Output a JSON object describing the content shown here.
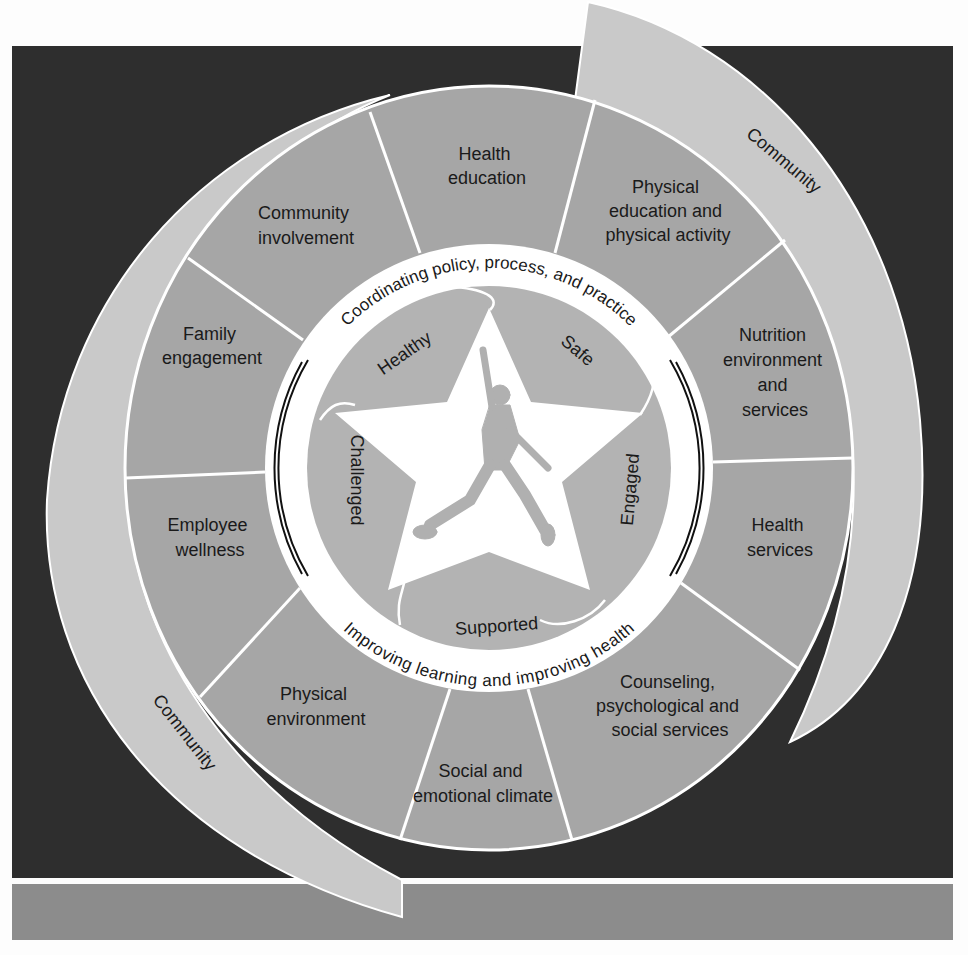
{
  "colors": {
    "background": "#fdfdfd",
    "dark_panel": "#2e2e2e",
    "bottom_bar": "#8c8c8c",
    "community_band": "#c9c9c9",
    "segment_fill": "#a6a6a6",
    "inner_ring": "#ffffff",
    "star_petals": "#b3b3b3",
    "star": "#ffffff",
    "figure": "#b0b0b0",
    "divider": "#ffffff",
    "text": "#1a1a1a"
  },
  "community": {
    "top_right_label": "Community",
    "bottom_left_label": "Community"
  },
  "segments": [
    {
      "label_lines": [
        "Health",
        "education"
      ]
    },
    {
      "label_lines": [
        "Physical",
        "education and",
        "physical activity"
      ]
    },
    {
      "label_lines": [
        "Nutrition",
        "environment",
        "and",
        "services"
      ]
    },
    {
      "label_lines": [
        "Health",
        "services"
      ]
    },
    {
      "label_lines": [
        "Counseling,",
        "psychological and",
        "social services"
      ]
    },
    {
      "label_lines": [
        "Social and",
        "emotional climate"
      ]
    },
    {
      "label_lines": [
        "Physical",
        "environment"
      ]
    },
    {
      "label_lines": [
        "Employee",
        "wellness"
      ]
    },
    {
      "label_lines": [
        "Family",
        "engagement"
      ]
    },
    {
      "label_lines": [
        "Community",
        "involvement"
      ]
    }
  ],
  "ring": {
    "top_text": "Coordinating policy, process, and practice",
    "bottom_text": "Improving learning and improving health"
  },
  "tenets": {
    "healthy": "Healthy",
    "safe": "Safe",
    "engaged": "Engaged",
    "supported": "Supported",
    "challenged": "Challenged"
  }
}
